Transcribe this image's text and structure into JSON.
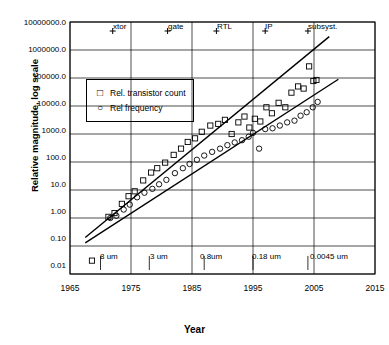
{
  "chart_data": {
    "type": "scatter",
    "title": "",
    "xlabel": "Year",
    "ylabel": "Relative magnitude, log scale",
    "xlim": [
      1965,
      2015
    ],
    "ylim": [
      0.01,
      10000000.0
    ],
    "log_y": true,
    "grid": true,
    "legend_position": "upper-left-inside",
    "x_ticks": [
      "1965",
      "1975",
      "1985",
      "1995",
      "2005",
      "2015"
    ],
    "y_ticks": [
      "10000000.0",
      "1000000.0",
      "100000.0",
      "10000.0",
      "1000.0",
      "100.0",
      "10.0",
      "1.00",
      "0.10",
      "0.01"
    ],
    "top_annotations": [
      {
        "label": "xtor",
        "x": 1972
      },
      {
        "label": "gate",
        "x": 1981
      },
      {
        "label": "RTL",
        "x": 1989
      },
      {
        "label": "IP",
        "x": 1997
      },
      {
        "label": "subsyst.",
        "x": 2004
      }
    ],
    "node_annotations": [
      {
        "label": "8 um",
        "x": 1970
      },
      {
        "label": "3 um",
        "x": 1978
      },
      {
        "label": "0.8um",
        "x": 1987
      },
      {
        "label": "0.18 um",
        "x": 1995
      },
      {
        "label": "0.0045 um",
        "x": 2004
      }
    ],
    "series": [
      {
        "name": "Rel. transistor count",
        "marker": "square",
        "points": [
          [
            1968.6,
            0.03
          ],
          [
            1971.3,
            1.1
          ],
          [
            1972.3,
            1.5
          ],
          [
            1973.5,
            3.2
          ],
          [
            1974.6,
            6.0
          ],
          [
            1975.6,
            9.0
          ],
          [
            1977.0,
            22.0
          ],
          [
            1978.3,
            42.0
          ],
          [
            1979.3,
            60.0
          ],
          [
            1980.6,
            95.0
          ],
          [
            1982.0,
            180.0
          ],
          [
            1983.2,
            300.0
          ],
          [
            1984.3,
            520.0
          ],
          [
            1985.5,
            700.0
          ],
          [
            1986.6,
            1200.0
          ],
          [
            1988.0,
            2000.0
          ],
          [
            1989.3,
            2300.0
          ],
          [
            1990.4,
            3200.0
          ],
          [
            1991.5,
            1000.0
          ],
          [
            1992.6,
            2600.0
          ],
          [
            1993.6,
            4200.0
          ],
          [
            1994.4,
            1700.0
          ],
          [
            1995.3,
            3500.0
          ],
          [
            1996.2,
            2800.0
          ],
          [
            1997.2,
            9000.0
          ],
          [
            1998.1,
            5500.0
          ],
          [
            1999.2,
            13000.0
          ],
          [
            2000.3,
            9000.0
          ],
          [
            2001.3,
            30000.0
          ],
          [
            2002.4,
            50000.0
          ],
          [
            2003.3,
            42000.0
          ],
          [
            2004.2,
            260000.0
          ],
          [
            2004.9,
            78000.0
          ],
          [
            2005.4,
            85000.0
          ]
        ]
      },
      {
        "name": "Rel frequency",
        "marker": "circle",
        "points": [
          [
            1971.6,
            1.0
          ],
          [
            1972.6,
            1.2
          ],
          [
            1973.8,
            2.0
          ],
          [
            1974.8,
            3.0
          ],
          [
            1976.0,
            5.5
          ],
          [
            1977.2,
            8.0
          ],
          [
            1978.5,
            11.0
          ],
          [
            1979.6,
            16.0
          ],
          [
            1980.8,
            23.0
          ],
          [
            1982.2,
            40.0
          ],
          [
            1983.5,
            60.0
          ],
          [
            1984.6,
            85.0
          ],
          [
            1985.8,
            120.0
          ],
          [
            1987.0,
            170.0
          ],
          [
            1988.3,
            230.0
          ],
          [
            1989.6,
            300.0
          ],
          [
            1990.8,
            400.0
          ],
          [
            1992.0,
            500.0
          ],
          [
            1993.2,
            600.0
          ],
          [
            1994.3,
            800.0
          ],
          [
            1995.0,
            1100.0
          ],
          [
            1996.0,
            300.0
          ],
          [
            1997.0,
            1500.0
          ],
          [
            1998.2,
            1600.0
          ],
          [
            1999.4,
            2000.0
          ],
          [
            2000.6,
            2600.0
          ],
          [
            2001.8,
            3000.0
          ],
          [
            2002.8,
            4500.0
          ],
          [
            2003.8,
            6000.0
          ],
          [
            2004.8,
            9000.0
          ],
          [
            2005.6,
            14000.0
          ]
        ]
      }
    ],
    "trend_lines": [
      {
        "name": "transistor-count-trend",
        "x0": 1967.5,
        "y0": 0.2,
        "x1": 2007.5,
        "y1": 3000000.0
      },
      {
        "name": "frequency-trend",
        "x0": 1967.5,
        "y0": 0.13,
        "x1": 2009.0,
        "y1": 90000.0
      }
    ]
  },
  "legend": {
    "items": [
      {
        "symbol": "square",
        "label": "Rel. transistor count"
      },
      {
        "symbol": "circle",
        "label": "Rel frequency"
      }
    ]
  },
  "axes": {
    "x_title": "Year",
    "y_title": "Relative magnitude, log scale"
  }
}
